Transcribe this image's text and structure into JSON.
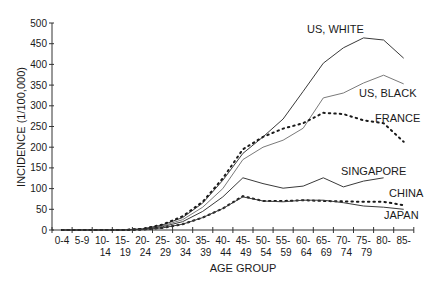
{
  "chart_data": {
    "type": "line",
    "title": "",
    "xlabel": "AGE GROUP",
    "ylabel": "INCIDENCE (1/100,000)",
    "ylim": [
      0,
      500
    ],
    "yticks": [
      0,
      50,
      100,
      150,
      200,
      250,
      300,
      350,
      400,
      450,
      500
    ],
    "grid": false,
    "legend_position": "inline labels at line ends",
    "categories": [
      "0-4",
      "5-9",
      "10-14",
      "15-19",
      "20-24",
      "25-29",
      "30-34",
      "35-39",
      "40-44",
      "45-49",
      "50-54",
      "55-59",
      "60-64",
      "65-69",
      "70-74",
      "75-79",
      "80-",
      "85-"
    ],
    "category_labels": [
      [
        "0-4",
        ""
      ],
      [
        "5-9",
        ""
      ],
      [
        "10-",
        "14"
      ],
      [
        "15-",
        "19"
      ],
      [
        "20-",
        "24"
      ],
      [
        "25-",
        "29"
      ],
      [
        "30-",
        "34"
      ],
      [
        "35-",
        "39"
      ],
      [
        "40-",
        "44"
      ],
      [
        "45-",
        "49"
      ],
      [
        "50-",
        "54"
      ],
      [
        "55-",
        "59"
      ],
      [
        "60-",
        "64"
      ],
      [
        "65-",
        "69"
      ],
      [
        "70-",
        "74"
      ],
      [
        "75-",
        "79"
      ],
      [
        "80-",
        ""
      ],
      [
        "85-",
        ""
      ]
    ],
    "series": [
      {
        "name": "US, WHITE",
        "style": "solid",
        "values": [
          0,
          0,
          0,
          0,
          3,
          12,
          30,
          65,
          120,
          185,
          225,
          268,
          335,
          403,
          440,
          464,
          459,
          415
        ]
      },
      {
        "name": "US, BLACK",
        "style": "solid-light",
        "values": [
          0,
          0,
          0,
          0,
          2,
          10,
          25,
          55,
          100,
          170,
          200,
          217,
          246,
          319,
          331,
          355,
          374,
          353
        ]
      },
      {
        "name": "FRANCE",
        "style": "dotted",
        "values": [
          0,
          0,
          0,
          0,
          3,
          13,
          33,
          68,
          125,
          195,
          225,
          245,
          258,
          283,
          280,
          265,
          258,
          213
        ]
      },
      {
        "name": "SINGAPORE",
        "style": "solid",
        "values": [
          0,
          0,
          0,
          0,
          2,
          8,
          20,
          45,
          80,
          126,
          112,
          101,
          106,
          126,
          104,
          118,
          126,
          null
        ]
      },
      {
        "name": "CHINA",
        "style": "dotted",
        "values": [
          0,
          0,
          0,
          0,
          1,
          5,
          14,
          30,
          52,
          82,
          70,
          70,
          72,
          70,
          69,
          68,
          68,
          60
        ]
      },
      {
        "name": "JAPAN",
        "style": "solid",
        "values": [
          0,
          0,
          0,
          0,
          1,
          5,
          14,
          30,
          52,
          80,
          70,
          68,
          72,
          72,
          66,
          58,
          55,
          50
        ]
      }
    ]
  }
}
